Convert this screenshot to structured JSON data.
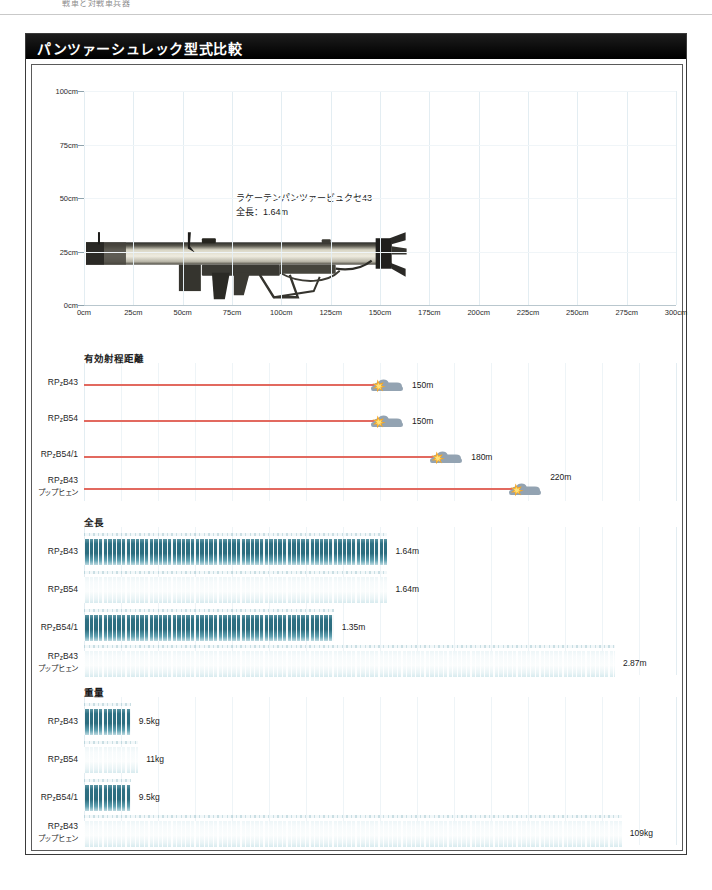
{
  "page": {
    "top_text": "戦車と対戦車兵器"
  },
  "panel": {
    "title": "パンツァーシュレック型式比較"
  },
  "chart_data": [
    {
      "type": "silhouette-scale",
      "title": "ラケーテンパンツァービュクセ43",
      "subtitle": "全長：1.64m",
      "xlabel": "",
      "ylabel": "",
      "xlim": [
        0,
        300
      ],
      "ylim": [
        0,
        100
      ],
      "x_unit": "cm",
      "y_unit": "cm",
      "xticks": [
        "0cm",
        "25cm",
        "50cm",
        "75cm",
        "100cm",
        "125cm",
        "150cm",
        "175cm",
        "200cm",
        "225cm",
        "250cm",
        "275cm",
        "300cm"
      ],
      "xtick_values": [
        0,
        25,
        50,
        75,
        100,
        125,
        150,
        175,
        200,
        225,
        250,
        275,
        300
      ],
      "yticks": [
        "0cm",
        "25cm",
        "50cm",
        "75cm",
        "100cm"
      ],
      "ytick_values": [
        0,
        25,
        50,
        75,
        100
      ],
      "grid": true,
      "object_length_cm": 164,
      "object_height_cm": 38
    },
    {
      "type": "bar",
      "title": "有効射程距離",
      "orientation": "horizontal",
      "unit": "m",
      "xlim": [
        0,
        300
      ],
      "grid": true,
      "marker": "tank-hit-icon",
      "series_color": "#e2695f",
      "categories": [
        "RPzB43",
        "RPzB54",
        "RPzB54/1",
        "RPzB43 プップヒェン"
      ],
      "values": [
        150,
        150,
        180,
        220
      ],
      "value_labels": [
        "150m",
        "150m",
        "180m",
        "220m"
      ]
    },
    {
      "type": "bar",
      "title": "全長",
      "orientation": "horizontal",
      "unit": "m",
      "xlim": [
        0,
        3.2
      ],
      "grid": true,
      "categories": [
        "RPzB43",
        "RPzB54",
        "RPzB54/1",
        "RPzB43 プップヒェン"
      ],
      "values": [
        1.64,
        1.64,
        1.35,
        2.87
      ],
      "value_labels": [
        "1.64m",
        "1.64m",
        "1.35m",
        "2.87m"
      ],
      "bar_styles": [
        "solid",
        "faint",
        "solid",
        "faint"
      ]
    },
    {
      "type": "bar",
      "title": "重量",
      "orientation": "horizontal",
      "unit": "kg",
      "xlim": [
        0,
        120
      ],
      "grid": true,
      "categories": [
        "RPzB43",
        "RPzB54",
        "RPzB54/1",
        "RPzB43 プップヒェン"
      ],
      "values": [
        9.5,
        11,
        9.5,
        109
      ],
      "value_labels": [
        "9.5kg",
        "11kg",
        "9.5kg",
        "109kg"
      ],
      "bar_styles": [
        "solid",
        "faint",
        "solid",
        "faint"
      ]
    }
  ],
  "labels": {
    "rpzb43": "RPzB43",
    "rpzb54": "RPzB54",
    "rpzb541": "RPzB54/1",
    "puppchen_l1": "RPzB43",
    "puppchen_l2": "プップヒェン"
  },
  "colors": {
    "title_bar": "#000000",
    "title_text": "#ffffff",
    "range_line": "#e2695f",
    "bar_teal": "#2e7083",
    "bar_faint": "#eef6f8",
    "grid": "#eef4f7",
    "tank_icon": "#8f9fae",
    "burst_icon": "#f5a623"
  }
}
